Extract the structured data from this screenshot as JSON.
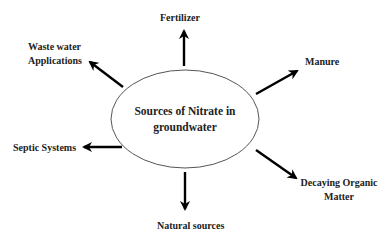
{
  "diagram": {
    "type": "radial-concept-map",
    "center": {
      "line1": "Sources of Nitrate in",
      "line2": "groundwater"
    },
    "nodes": [
      {
        "id": "fertilizer",
        "label": "Fertilizer"
      },
      {
        "id": "manure",
        "label": "Manure"
      },
      {
        "id": "decaying",
        "line1": "Decaying Organic",
        "line2": "Matter"
      },
      {
        "id": "natural",
        "label": "Natural sources"
      },
      {
        "id": "septic",
        "label": "Septic Systems"
      },
      {
        "id": "wastewater",
        "line1": "Waste water",
        "line2": "Applications"
      }
    ],
    "colors": {
      "text": "#222222",
      "arrow": "#000000",
      "ellipse_stroke": "#555555",
      "background": "#ffffff"
    }
  }
}
